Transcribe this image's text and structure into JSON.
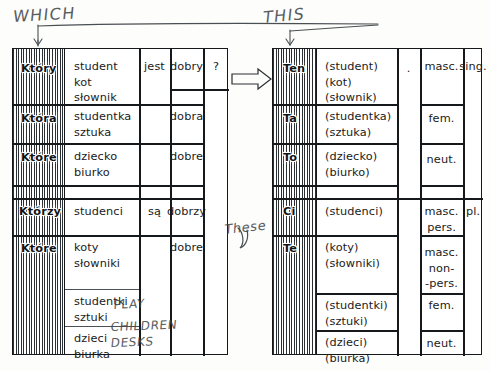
{
  "annotations": {
    "which": "WHICH",
    "this": "THIS",
    "these": "These",
    "plays": "PLAY",
    "children": "CHILDREN",
    "desks": "DESKS"
  },
  "left_table": {
    "name": "interrogative-adjective-table",
    "rows": [
      {
        "pronoun": "Który",
        "nouns": [
          "student",
          "kot",
          "słownik"
        ],
        "verb": "jest",
        "adjective": "dobry",
        "mark": "?"
      },
      {
        "pronoun": "Która",
        "nouns": [
          "studentka",
          "sztuka"
        ],
        "verb": "",
        "adjective": "dobra",
        "mark": ""
      },
      {
        "pronoun": "Które",
        "nouns": [
          "dziecko",
          "biurko"
        ],
        "verb": "",
        "adjective": "dobre",
        "mark": ""
      },
      {
        "pronoun": "Którzy",
        "nouns": [
          "studenci"
        ],
        "verb": "są",
        "adjective": "dobrzy",
        "mark": ""
      },
      {
        "pronoun": "Które",
        "nouns": [
          "koty",
          "słowniki"
        ],
        "verb": "",
        "adjective": "dobre",
        "mark": ""
      },
      {
        "pronoun": "",
        "nouns": [
          "studentki",
          "sztuki"
        ],
        "verb": "",
        "adjective": "",
        "mark": ""
      },
      {
        "pronoun": "",
        "nouns": [
          "dzieci",
          "biurka"
        ],
        "verb": "",
        "adjective": "",
        "mark": ""
      }
    ]
  },
  "right_table": {
    "name": "demonstrative-pronoun-table",
    "rows": [
      {
        "pronoun": "Ten",
        "nouns": [
          "(student)",
          "(kot)",
          "(słownik)"
        ],
        "mark": ".",
        "gender": [
          "masc."
        ],
        "number": "sing."
      },
      {
        "pronoun": "Ta",
        "nouns": [
          "(studentka)",
          "(sztuka)"
        ],
        "mark": "",
        "gender": [
          "fem."
        ],
        "number": ""
      },
      {
        "pronoun": "To",
        "nouns": [
          "(dziecko)",
          "(biurko)"
        ],
        "mark": "",
        "gender": [
          "neut."
        ],
        "number": ""
      },
      {
        "pronoun": "Ci",
        "nouns": [
          "(studenci)"
        ],
        "mark": "",
        "gender": [
          "masc.",
          "pers."
        ],
        "number": "pl."
      },
      {
        "pronoun": "Te",
        "nouns": [
          "(koty)",
          "(słowniki)"
        ],
        "mark": "",
        "gender": [
          "masc.",
          "non-",
          "-pers."
        ],
        "number": ""
      },
      {
        "pronoun": "",
        "nouns": [
          "(studentki)",
          "(sztuki)"
        ],
        "mark": "",
        "gender": [
          "fem."
        ],
        "number": ""
      },
      {
        "pronoun": "",
        "nouns": [
          "(dzieci)",
          "(biurka)"
        ],
        "mark": "",
        "gender": [
          "neut."
        ],
        "number": ""
      }
    ]
  },
  "colors": {
    "ink": "#15191c",
    "pencil": "#43484c",
    "paper": "#fdfdfb"
  }
}
